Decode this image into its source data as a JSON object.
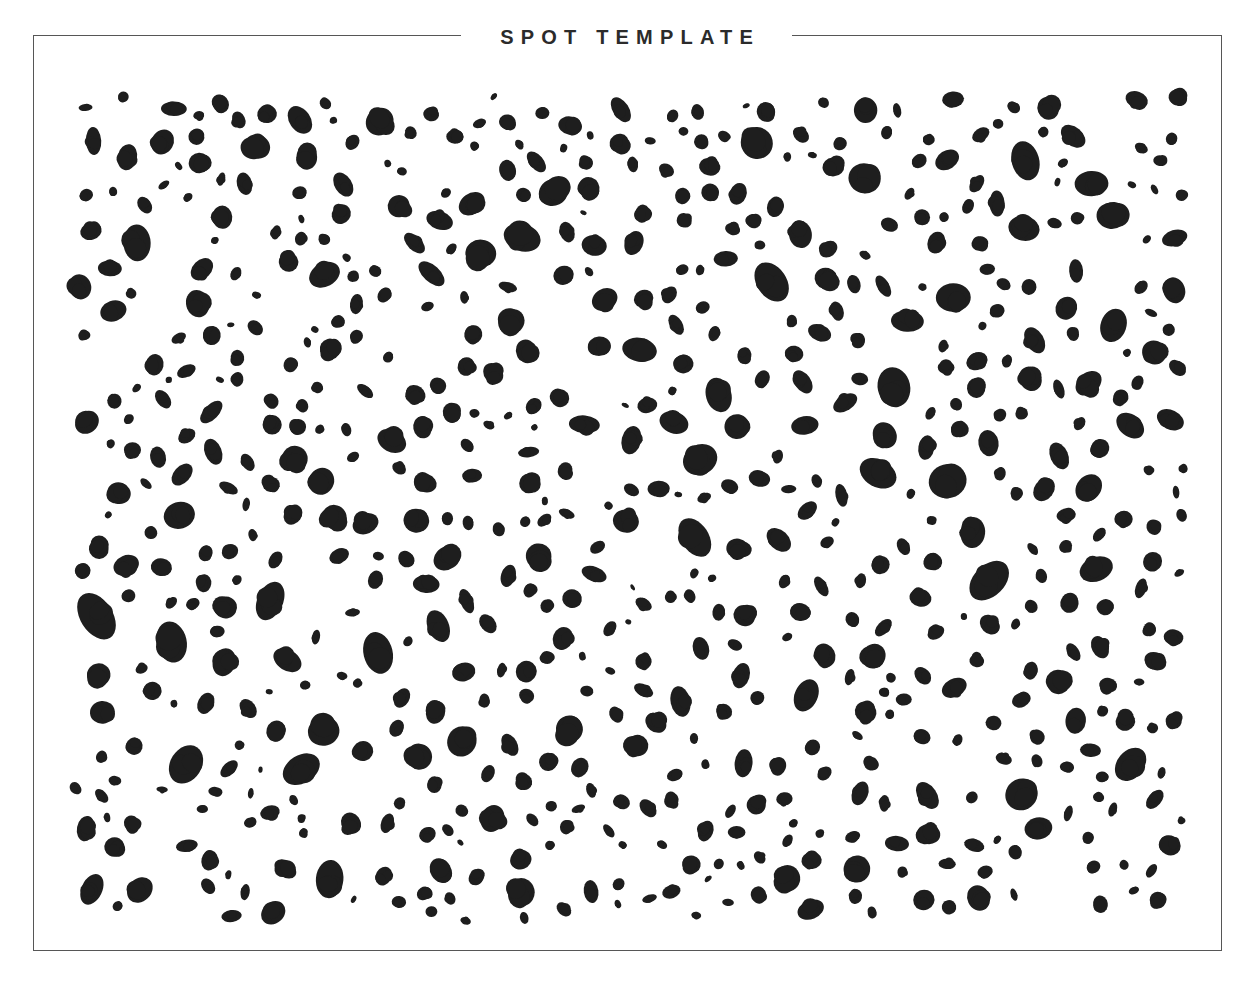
{
  "page": {
    "background_color": "#ffffff",
    "width": 1253,
    "height": 991
  },
  "frame": {
    "border_color": "#565656",
    "border_width_px": 1.5,
    "x": 33,
    "y": 35,
    "width": 1189,
    "height": 916
  },
  "header": {
    "title": "SPOT TEMPLATE",
    "title_color": "#2b2b2b"
  },
  "chart_data": {
    "type": "scatter",
    "title": "SPOT TEMPLATE",
    "xlabel": "",
    "ylabel": "",
    "subtitle": "",
    "legend": [],
    "grid": false,
    "xlim": [
      0,
      1124
    ],
    "ylim": [
      0,
      842
    ],
    "marker": {
      "shape": "ellipse",
      "fill_color": "#1e1e1e",
      "edge": "irregular-soft",
      "min_radius_px": 3,
      "max_radius_px": 18
    },
    "spot_count": 660,
    "density_per_10000px2": 7.0,
    "size_range_px": [
      5,
      36
    ],
    "rotation_range_deg": [
      0,
      180
    ],
    "aspect_ratio_range": [
      0.5,
      1.6
    ],
    "field": {
      "x": 66,
      "y": 86,
      "width": 1124,
      "height": 842
    },
    "points": []
  }
}
